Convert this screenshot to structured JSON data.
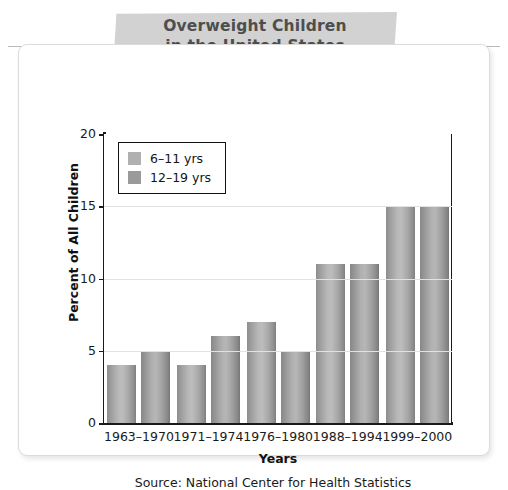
{
  "chart_data": {
    "type": "bar",
    "title": "Overweight Children in the United States",
    "title_line1": "Overweight Children",
    "title_line2": "in the United States",
    "xlabel": "Years",
    "ylabel": "Percent of All Children",
    "categories": [
      "1963–1970",
      "1971–1974",
      "1976–1980",
      "1988–1994",
      "1999–2000"
    ],
    "series": [
      {
        "name": "6–11 yrs",
        "color": "#b0b0b0",
        "values": [
          4,
          4,
          7,
          11,
          15
        ]
      },
      {
        "name": "12–19 yrs",
        "color": "#9a9a9a",
        "values": [
          5,
          6,
          5,
          11,
          15
        ]
      }
    ],
    "ylim": [
      0,
      20
    ],
    "yticks": [
      0,
      5,
      10,
      15,
      20
    ],
    "ytick_labels": [
      "0",
      "5",
      "10",
      "15",
      "20"
    ],
    "grid": true,
    "legend_position": "top-left",
    "source": "Source: National Center for Health Statistics"
  },
  "legend": {
    "items": [
      {
        "label": "6–11 yrs",
        "swatch": "#b0b0b0"
      },
      {
        "label": "12–19 yrs",
        "swatch": "#9a9a9a"
      }
    ]
  },
  "colors": {
    "banner": "#d2d2d2",
    "title_text": "#4e4e4e",
    "axis": "#1a1a1a",
    "gridline": "#e2e2e2",
    "card_border": "#dcdcdc"
  }
}
